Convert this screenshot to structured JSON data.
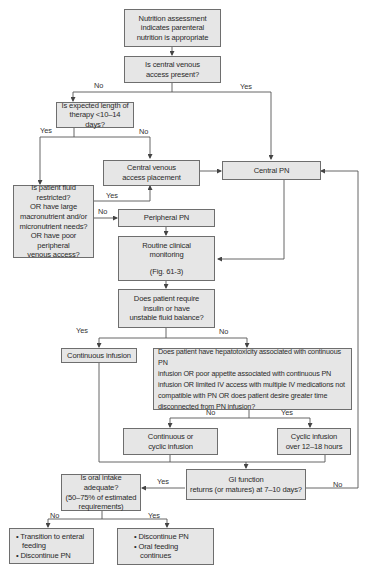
{
  "diagram": {
    "type": "flowchart",
    "nodes": {
      "start": {
        "lines": [
          "Nutrition assessment",
          "indicates parenteral",
          "nutrition is appropriate"
        ]
      },
      "central_access_q": {
        "lines": [
          "Is central venous",
          "access present?"
        ]
      },
      "therapy_length_q": {
        "lines": [
          "Is expected length of",
          "therapy <10–14 days?"
        ]
      },
      "central_access_placement": {
        "lines": [
          "Central venous",
          "access placement"
        ]
      },
      "central_pn": {
        "lines": [
          "Central PN"
        ]
      },
      "fluid_restricted_q": {
        "lines": [
          "Is patient fluid restricted?",
          "OR have large",
          "macronutrient and/or",
          "micronutrient needs?",
          "OR have poor",
          "peripheral",
          "venous access?"
        ]
      },
      "peripheral_pn": {
        "lines": [
          "Peripheral PN"
        ]
      },
      "monitoring": {
        "lines": [
          "Routine clinical",
          "monitoring",
          "",
          "(Fig. 61-3)"
        ]
      },
      "insulin_q": {
        "lines": [
          "Does patient require",
          "insulin or have",
          "unstable fluid balance?"
        ]
      },
      "continuous_infusion": {
        "lines": [
          "Continuous infusion"
        ]
      },
      "hepatotoxicity_q": {
        "lines": [
          "Does patient have hepatotoxicity associated with continuous PN",
          "infusion OR poor appetite associated with continuous PN",
          "infusion OR limited IV access with multiple IV medications not",
          "compatible with PN OR does patient desire greater time",
          "disconnected from PN infusion?"
        ]
      },
      "continuous_or_cyclic": {
        "lines": [
          "Continuous or",
          "cyclic infusion"
        ]
      },
      "cyclic_infusion": {
        "lines": [
          "Cyclic infusion",
          "over 12–18 hours"
        ]
      },
      "gi_function_q": {
        "lines": [
          "GI function",
          "returns (or matures) at 7–10 days?"
        ]
      },
      "oral_intake_q": {
        "lines": [
          "Is oral intake adequate?",
          "(50–75% of estimated",
          "requirements)"
        ]
      },
      "enteral_transition": {
        "bullets": [
          "Transition to enteral",
          "feeding",
          "Discontinue PN"
        ]
      },
      "oral_feeding": {
        "bullets": [
          "Discontinue PN",
          "Oral feeding",
          "continues"
        ]
      }
    },
    "edge_labels": {
      "central_no": "No",
      "central_yes": "Yes",
      "length_yes": "Yes",
      "length_no": "No",
      "fluid_yes": "Yes",
      "fluid_no": "No",
      "insulin_yes": "Yes",
      "insulin_no": "No",
      "hepato_no": "No",
      "hepato_yes": "Yes",
      "gi_yes": "Yes",
      "gi_no": "No",
      "oral_no": "No",
      "oral_yes": "Yes"
    },
    "colors": {
      "box_fill": "#e6e6e6",
      "box_border": "#6e6e6e",
      "line": "#555555",
      "background": "#ffffff"
    }
  }
}
